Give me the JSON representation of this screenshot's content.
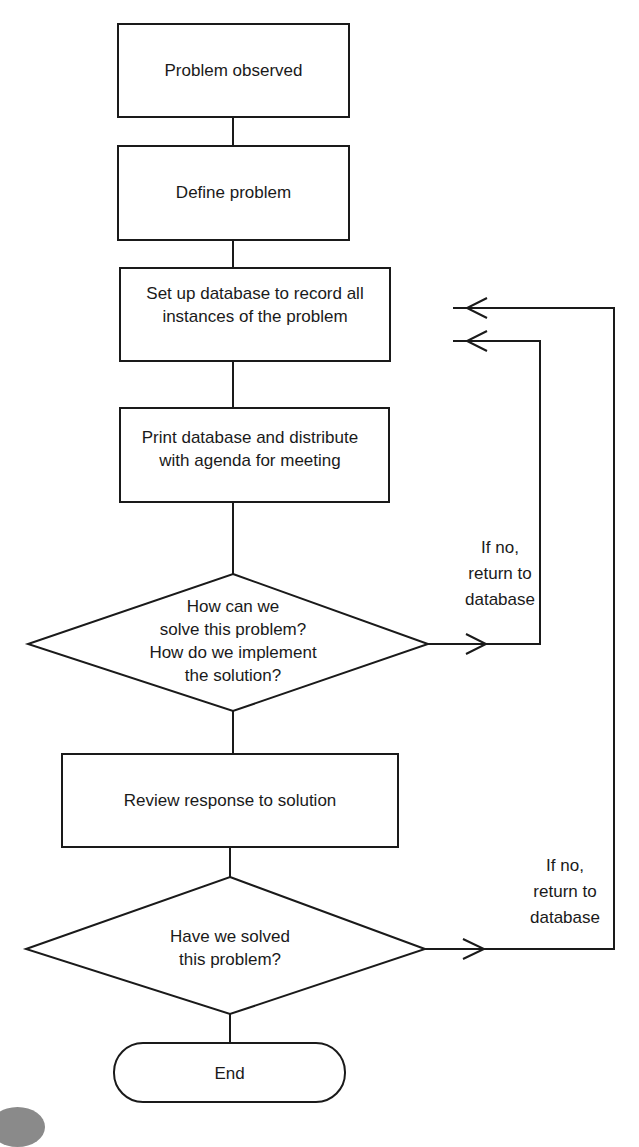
{
  "diagram": {
    "type": "flowchart",
    "nodes": [
      {
        "id": "n1",
        "shape": "rectangle",
        "text": "Problem observed"
      },
      {
        "id": "n2",
        "shape": "rectangle",
        "text": "Define problem"
      },
      {
        "id": "n3",
        "shape": "rectangle",
        "text": "Set up database to record all\ninstances of the problem"
      },
      {
        "id": "n4",
        "shape": "rectangle",
        "text": "Print database and distribute\nwith agenda for meeting"
      },
      {
        "id": "n5",
        "shape": "diamond",
        "text": "How can we\nsolve this problem?\nHow do we implement\nthe solution?"
      },
      {
        "id": "n6",
        "shape": "rectangle",
        "text": "Review response to solution"
      },
      {
        "id": "n7",
        "shape": "diamond",
        "text": "Have we solved\nthis problem?"
      },
      {
        "id": "n8",
        "shape": "terminator",
        "text": "End"
      }
    ],
    "edges": [
      {
        "from": "n1",
        "to": "n2"
      },
      {
        "from": "n2",
        "to": "n3"
      },
      {
        "from": "n3",
        "to": "n4"
      },
      {
        "from": "n4",
        "to": "n5"
      },
      {
        "from": "n5",
        "to": "n6"
      },
      {
        "from": "n5",
        "to": "n3",
        "label": "If no,\nreturn to\ndatabase"
      },
      {
        "from": "n6",
        "to": "n7"
      },
      {
        "from": "n7",
        "to": "n3",
        "label": "If no,\nreturn to\ndatabase"
      },
      {
        "from": "n7",
        "to": "n8"
      }
    ],
    "loop_label_1": "If no,\nreturn to\ndatabase",
    "loop_label_2": "If no,\nreturn to\ndatabase"
  }
}
